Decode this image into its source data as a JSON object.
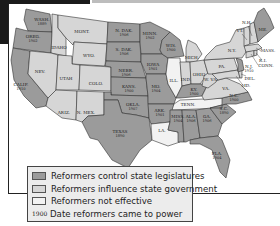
{
  "map": {
    "title": "Progressive Reform in the States",
    "colors": {
      "control": "#9b9b9b",
      "influence": "#d6d6d6",
      "not_effective": "#f2f2f2"
    },
    "states": {
      "wash": {
        "label": "WASH.",
        "year": "1889",
        "category": "control"
      },
      "oreg": {
        "label": "OREG.",
        "year": "1902",
        "category": "control"
      },
      "calif": {
        "label": "CALIF.",
        "year": "1910",
        "category": "control"
      },
      "idaho": {
        "label": "IDAHO",
        "year": "",
        "category": "influence"
      },
      "nev": {
        "label": "NEV.",
        "year": "",
        "category": "influence"
      },
      "mont": {
        "label": "MONT.",
        "year": "",
        "category": "influence"
      },
      "wyo": {
        "label": "WYO.",
        "year": "",
        "category": "influence"
      },
      "utah": {
        "label": "UTAH",
        "year": "",
        "category": "influence"
      },
      "colo": {
        "label": "COLO.",
        "year": "",
        "category": "influence"
      },
      "ariz": {
        "label": "ARIZ.",
        "year": "",
        "category": "influence"
      },
      "nmex": {
        "label": "N. MEX.",
        "year": "",
        "category": "influence"
      },
      "ndak": {
        "label": "N. DAK.",
        "year": "1906",
        "category": "control"
      },
      "sdak": {
        "label": "S. DAK.",
        "year": "1906",
        "category": "control"
      },
      "nebr": {
        "label": "NEBR.",
        "year": "1906",
        "category": "control"
      },
      "kans": {
        "label": "KANS.",
        "year": "1900",
        "category": "control"
      },
      "okla": {
        "label": "OKLA.",
        "year": "1907",
        "category": "control"
      },
      "texas": {
        "label": "TEXAS",
        "year": "1890",
        "category": "control"
      },
      "minn": {
        "label": "MINN.",
        "year": "1902",
        "category": "control"
      },
      "iowa": {
        "label": "IOWA",
        "year": "1901",
        "category": "control"
      },
      "mo": {
        "label": "MO.",
        "year": "1904",
        "category": "control"
      },
      "ark": {
        "label": "ARK.",
        "year": "1901",
        "category": "control"
      },
      "la": {
        "label": "LA.",
        "year": "",
        "category": "not_effective"
      },
      "wis": {
        "label": "WIS.",
        "year": "1900",
        "category": "control"
      },
      "ill": {
        "label": "ILL.",
        "year": "",
        "category": "not_effective"
      },
      "mich": {
        "label": "MICH.",
        "year": "",
        "category": "influence"
      },
      "ind": {
        "label": "IND.",
        "year": "",
        "category": "influence"
      },
      "ohio": {
        "label": "OHIO",
        "year": "",
        "category": "influence"
      },
      "ky": {
        "label": "KY.",
        "year": "1900",
        "category": "control"
      },
      "tenn": {
        "label": "TENN.",
        "year": "",
        "category": "not_effective"
      },
      "miss": {
        "label": "MISS.",
        "year": "1904",
        "category": "control"
      },
      "ala": {
        "label": "ALA.",
        "year": "1906",
        "category": "control"
      },
      "ga": {
        "label": "GA.",
        "year": "1906",
        "category": "control"
      },
      "fla": {
        "label": "FLA.",
        "year": "1904",
        "category": "control"
      },
      "sc": {
        "label": "S.C.",
        "year": "1890",
        "category": "control"
      },
      "nc": {
        "label": "N.C.",
        "year": "1900",
        "category": "control"
      },
      "va": {
        "label": "VA.",
        "year": "",
        "category": "influence"
      },
      "wva": {
        "label": "W. VA.",
        "year": "",
        "category": "influence"
      },
      "pa": {
        "label": "PA.",
        "year": "",
        "category": "influence"
      },
      "ny": {
        "label": "N.Y.",
        "year": "",
        "category": "influence"
      },
      "nj": {
        "label": "N.J.",
        "year": "1910",
        "category": "control"
      },
      "del": {
        "label": "DEL.",
        "year": "",
        "category": "influence"
      },
      "md": {
        "label": "MD.",
        "year": "",
        "category": "influence"
      },
      "conn": {
        "label": "CONN.",
        "year": "",
        "category": "influence"
      },
      "ri": {
        "label": "R.I.",
        "year": "",
        "category": "influence"
      },
      "mass": {
        "label": "MASS.",
        "year": "",
        "category": "influence"
      },
      "vt": {
        "label": "VT.",
        "year": "",
        "category": "influence"
      },
      "nh": {
        "label": "N.H.",
        "year": "",
        "category": "influence"
      },
      "me": {
        "label": "ME.",
        "year": "",
        "category": "control"
      }
    }
  },
  "legend": {
    "items": [
      {
        "label": "Reformers control state legislatures",
        "swatch": "control"
      },
      {
        "label": "Reformers influence state government",
        "swatch": "influence"
      },
      {
        "label": "Reformers not effective",
        "swatch": "not_effective"
      }
    ],
    "date_sample": "1900",
    "date_label": "Date reformers came to power"
  }
}
